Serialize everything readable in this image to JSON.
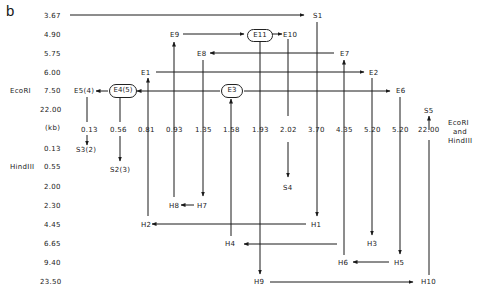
{
  "panel_label": "b",
  "left_axis": {
    "ecori_label": "EcoRI",
    "hindiii_label": "HindIII",
    "unit_label": "(kb)",
    "ecori_values": [
      "3.67",
      "4.90",
      "5.75",
      "6.00",
      "7.50",
      "22.00"
    ],
    "hindiii_values": [
      "0.13",
      "0.55",
      "2.00",
      "2.30",
      "4.45",
      "6.65",
      "9.40",
      "23.50"
    ]
  },
  "double_digest": {
    "label_line1": "EcoRI",
    "label_line2": "and",
    "label_line3": "HindIII",
    "values": [
      "0.13",
      "0.56",
      "0.81",
      "0.93",
      "1.35",
      "1.58",
      "1.93",
      "2.02",
      "3.70",
      "4.35",
      "5.20",
      "5.20",
      "22.00"
    ]
  },
  "ecori_fragments": {
    "S1": "S1",
    "E9": "E9",
    "E11": "E11",
    "E10": "E10",
    "E8": "E8",
    "E7": "E7",
    "E1": "E1",
    "E2": "E2",
    "E5": "E5(4)",
    "E4": "E4(5)",
    "E3": "E3",
    "E6": "E6",
    "S5": "S5"
  },
  "hindiii_fragments": {
    "S3": "S3(2)",
    "S2": "S2(3)",
    "S4": "S4",
    "H8": "H8",
    "H7": "H7",
    "H2": "H2",
    "H1": "H1",
    "H4": "H4",
    "H3": "H3",
    "H6": "H6",
    "H5": "H5",
    "H9": "H9",
    "H10": "H10"
  },
  "colors": {
    "ink": "#1a1a1a",
    "background": "#ffffff"
  }
}
